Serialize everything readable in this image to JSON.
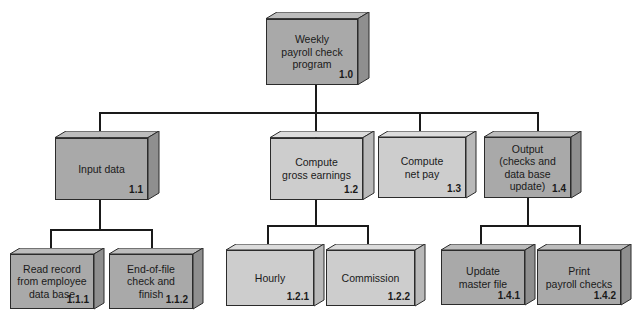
{
  "diagram": {
    "colors": {
      "dark_box": "#a9a9a9",
      "light_box": "#cdcdcd",
      "line": "#1a1a1a"
    },
    "nodes": [
      {
        "id": "1.0",
        "label": "Weekly\npayroll check\nprogram",
        "num": "1.0",
        "shade": "dark"
      },
      {
        "id": "1.1",
        "label": "Input data",
        "num": "1.1",
        "shade": "dark"
      },
      {
        "id": "1.2",
        "label": "Compute\ngross earnings",
        "num": "1.2",
        "shade": "light"
      },
      {
        "id": "1.3",
        "label": "Compute\nnet pay",
        "num": "1.3",
        "shade": "light"
      },
      {
        "id": "1.4",
        "label": "Output\n(checks and\ndata base update)",
        "num": "1.4",
        "shade": "dark"
      },
      {
        "id": "1.1.1",
        "label": "Read record\nfrom employee\ndata base",
        "num": "1.1.1",
        "shade": "dark"
      },
      {
        "id": "1.1.2",
        "label": "End-of-file\ncheck and\nfinish",
        "num": "1.1.2",
        "shade": "dark"
      },
      {
        "id": "1.2.1",
        "label": "Hourly",
        "num": "1.2.1",
        "shade": "light"
      },
      {
        "id": "1.2.2",
        "label": "Commission",
        "num": "1.2.2",
        "shade": "light"
      },
      {
        "id": "1.4.1",
        "label": "Update\nmaster file",
        "num": "1.4.1",
        "shade": "dark"
      },
      {
        "id": "1.4.2",
        "label": "Print\npayroll checks",
        "num": "1.4.2",
        "shade": "dark"
      }
    ],
    "edges": [
      [
        "1.0",
        "1.1"
      ],
      [
        "1.0",
        "1.2"
      ],
      [
        "1.0",
        "1.3"
      ],
      [
        "1.0",
        "1.4"
      ],
      [
        "1.1",
        "1.1.1"
      ],
      [
        "1.1",
        "1.1.2"
      ],
      [
        "1.2",
        "1.2.1"
      ],
      [
        "1.2",
        "1.2.2"
      ],
      [
        "1.4",
        "1.4.1"
      ],
      [
        "1.4",
        "1.4.2"
      ]
    ]
  }
}
